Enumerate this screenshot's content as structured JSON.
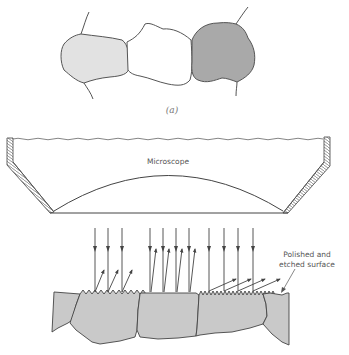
{
  "figure": {
    "part_a": {
      "caption": "(a)",
      "grains": [
        {
          "name": "light-grain",
          "fill": "#e2e2e2"
        },
        {
          "name": "white-grain",
          "fill": "#ffffff"
        },
        {
          "name": "dark-grain",
          "fill": "#a9a9a9"
        }
      ]
    },
    "part_b": {
      "microscope_label": "Microscope",
      "surface_label_line1": "Polished and",
      "surface_label_line2": "etched surface",
      "grain_fill": "#c9c9c9",
      "line_color": "#444444",
      "arrow_groups": [
        {
          "name": "rough-left-grain",
          "incident_x": [
            95,
            108,
            122
          ],
          "reflection": "scattered-angled"
        },
        {
          "name": "smooth-center-grain",
          "incident_x": [
            150,
            163,
            176,
            189
          ],
          "reflection": "near-vertical-back-to-microscope"
        },
        {
          "name": "rough-right-grain",
          "incident_x": [
            209,
            224,
            238,
            253
          ],
          "reflection": "shallow-angled"
        }
      ]
    }
  }
}
